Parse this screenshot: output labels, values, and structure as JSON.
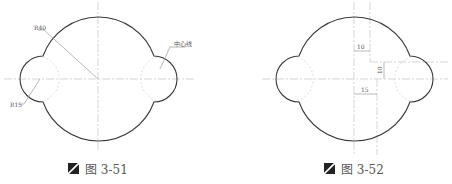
{
  "figures": [
    {
      "id": "fig-3-51",
      "caption": "图 3-51",
      "labels": {
        "large_radius": "R40",
        "small_radius": "R15",
        "centerline": "中心线"
      }
    },
    {
      "id": "fig-3-52",
      "caption": "图 3-52",
      "dimensions": {
        "top_offset": "10",
        "vertical_offset": "10",
        "bottom_offset": "15"
      }
    }
  ],
  "colors": {
    "outline": "#3a3a3a",
    "centerline": "#c4c4c4",
    "caption": "#555555"
  }
}
